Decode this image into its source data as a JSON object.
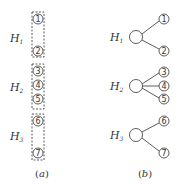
{
  "panels": {
    "a": {
      "caption": "a",
      "groups": [
        {
          "label": "H",
          "sub": "1",
          "nodes": [
            "1",
            "2"
          ]
        },
        {
          "label": "H",
          "sub": "2",
          "nodes": [
            "3",
            "4",
            "5"
          ]
        },
        {
          "label": "H",
          "sub": "3",
          "nodes": [
            "6",
            "7"
          ]
        }
      ]
    },
    "b": {
      "caption": "b",
      "groups": [
        {
          "label": "H",
          "sub": "1",
          "nodes": [
            "1",
            "2"
          ]
        },
        {
          "label": "H",
          "sub": "2",
          "nodes": [
            "3",
            "4",
            "5"
          ]
        },
        {
          "label": "H",
          "sub": "3",
          "nodes": [
            "6",
            "7"
          ]
        }
      ]
    }
  },
  "colors": {
    "stroke": "#333333",
    "background": "#ffffff"
  }
}
